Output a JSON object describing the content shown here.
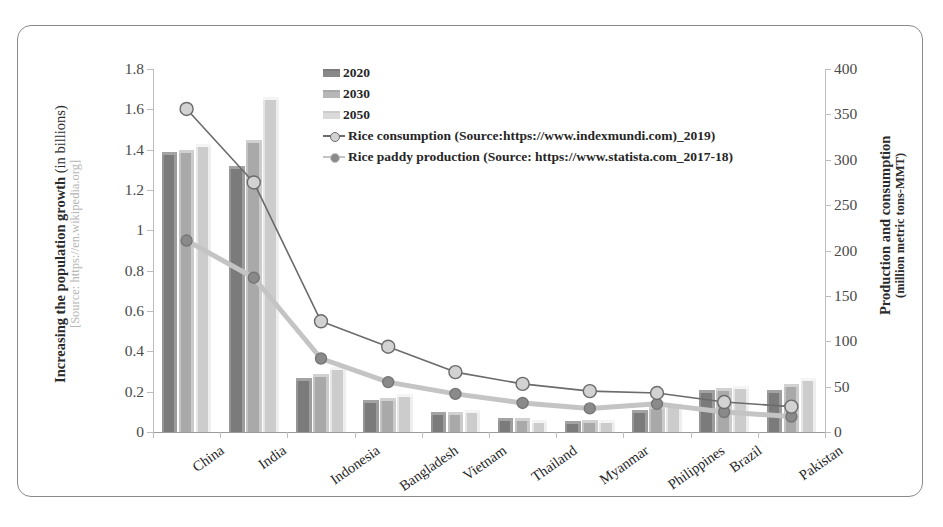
{
  "axes": {
    "left_title_bold": "Increasing the population growth ",
    "left_title_light": "(in billions)",
    "left_title_source": "[Source: https://en.wikipedia.org]",
    "right_title_line1": "Production and  consumption",
    "right_title_line2": "(million metric tons-MMT)",
    "left_ticks": [
      "1.8",
      "1.6",
      "1.4",
      "1.2",
      "1",
      "0.8",
      "0.6",
      "0.4",
      "0.2",
      "0"
    ],
    "right_ticks": [
      "400",
      "350",
      "300",
      "250",
      "200",
      "150",
      "100",
      "50",
      "0"
    ]
  },
  "legend": {
    "items": [
      {
        "label": "2020",
        "type": "bar",
        "color": "#7b7b7b"
      },
      {
        "label": "2030",
        "type": "bar",
        "color": "#a9a9a9"
      },
      {
        "label": "2050",
        "type": "bar",
        "color": "#cccccc"
      },
      {
        "label": "Rice consumption (Source:https://www.indexmundi.com)_2019)",
        "type": "line",
        "line_color": "#6b6b6b",
        "dot_color": "#d2d2d2"
      },
      {
        "label": "Rice paddy production (Source: https://www.statista.com_2017-18)",
        "type": "line",
        "line_color": "#c4c4c4",
        "dot_color": "#8a8a8a"
      }
    ]
  },
  "chart_data": {
    "type": "bar",
    "title": "",
    "xlabel": "",
    "ylabel": "Increasing the population growth (in billions) [Source: https://en.wikipedia.org]",
    "y2label": "Production and consumption (million metric tons-MMT)",
    "ylim": [
      0,
      1.8
    ],
    "y2lim": [
      0,
      400
    ],
    "ytick_step": 0.2,
    "y2tick_step": 50,
    "grid": false,
    "legend_position": "top-center",
    "categories": [
      "China",
      "India",
      "Indonesia",
      "Bangladesh",
      "Vietnam",
      "Thailand",
      "Myanmar",
      "Philippines",
      "Brazil",
      "Pakistan"
    ],
    "series": [
      {
        "name": "2020",
        "axis": "left",
        "unit": "billions",
        "type": "bar",
        "values": [
          1.39,
          1.32,
          0.27,
          0.16,
          0.1,
          0.07,
          0.055,
          0.11,
          0.21,
          0.21
        ]
      },
      {
        "name": "2030",
        "axis": "left",
        "unit": "billions",
        "type": "bar",
        "values": [
          1.4,
          1.45,
          0.29,
          0.17,
          0.1,
          0.07,
          0.06,
          0.13,
          0.22,
          0.24
        ]
      },
      {
        "name": "2050",
        "axis": "left",
        "unit": "billions",
        "type": "bar",
        "values": [
          1.43,
          1.66,
          0.32,
          0.19,
          0.11,
          0.06,
          0.06,
          0.14,
          0.23,
          0.27
        ]
      },
      {
        "name": "Rice consumption (Source:https://www.indexmundi.com)_2019)",
        "axis": "right",
        "unit": "MMT",
        "type": "line",
        "values": [
          356,
          275,
          122,
          94,
          66,
          53,
          45,
          43,
          33,
          28
        ]
      },
      {
        "name": "Rice paddy production (Source: https://www.statista.com_2017-18)",
        "axis": "right",
        "unit": "MMT",
        "type": "line",
        "values": [
          211,
          170,
          81,
          55,
          42,
          32,
          26,
          31,
          22,
          17
        ]
      }
    ]
  }
}
